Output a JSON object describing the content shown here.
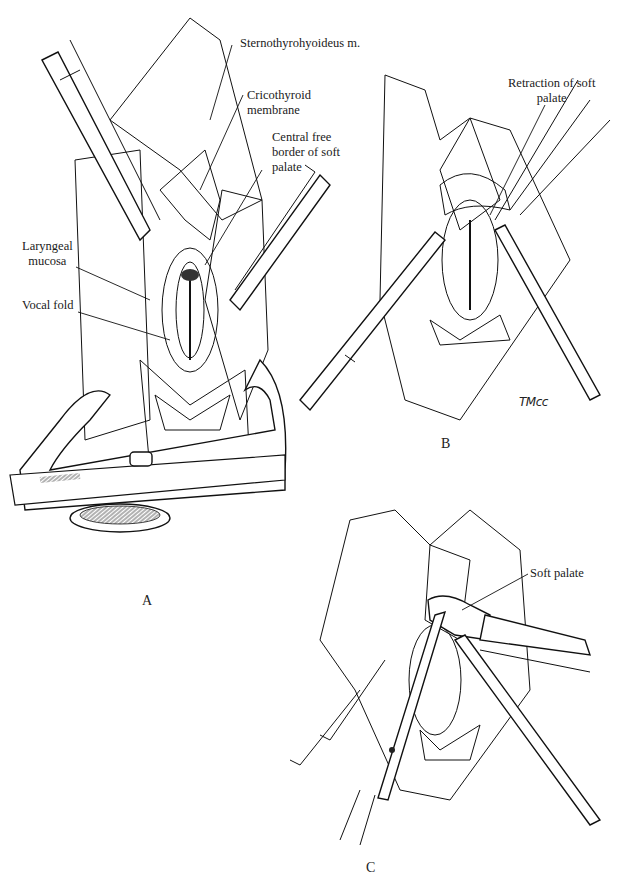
{
  "figure": {
    "panels": [
      {
        "id": "A",
        "letter": "A",
        "labels": [
          {
            "text_lines": [
              "Sternothyrohyoideus m."
            ]
          },
          {
            "text_lines": [
              "Cricothyroid",
              "membrane"
            ]
          },
          {
            "text_lines": [
              "Central free",
              "border of soft",
              "palate"
            ]
          },
          {
            "text_lines": [
              "Laryngeal",
              "mucosa"
            ]
          },
          {
            "text_lines": [
              "Vocal fold"
            ]
          }
        ]
      },
      {
        "id": "B",
        "letter": "B",
        "labels": [
          {
            "text_lines": [
              "Retraction of soft",
              "palate"
            ]
          }
        ],
        "signature": "TMcc"
      },
      {
        "id": "C",
        "letter": "C",
        "labels": [
          {
            "text_lines": [
              "Soft palate"
            ]
          }
        ]
      }
    ]
  },
  "colors": {
    "ink": "#1a1a1a",
    "paper": "#ffffff"
  }
}
